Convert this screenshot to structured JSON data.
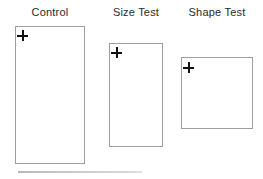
{
  "figure": {
    "panels": [
      {
        "label": "Control",
        "marker": "plus-icon"
      },
      {
        "label": "Size Test",
        "marker": "plus-icon"
      },
      {
        "label": "Shape Test",
        "marker": "plus-icon"
      }
    ],
    "colors": {
      "background": "#ffffff",
      "rect_border": "#9e9e9e",
      "marker": "#111111",
      "label_text": "#2b2b2b",
      "scan_line": "#c6c6c6"
    }
  }
}
